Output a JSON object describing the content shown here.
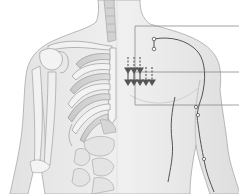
{
  "figure": {
    "left_half": "skeleton (ribcage, clavicle, scapula, humerus) with abdominal organs",
    "right_half": "skin surface with channel/meridian path over shoulder and down arm",
    "colors": {
      "background": "#ffffff",
      "skin": "#ececec",
      "skin_shade": "#d9d9d9",
      "outline": "#9a9a9a",
      "bone": "#f4f4f4",
      "bone_shade": "#c8c8c8",
      "meridian": "#555555",
      "leader_line": "#8a8a8a",
      "arrow": "#555555"
    },
    "leader_lines": [
      {
        "name": "upper-callout",
        "y": 26,
        "x_start": 135,
        "x_end": 239
      },
      {
        "name": "middle-callout",
        "y": 72,
        "x_start": 135,
        "x_end": 239
      },
      {
        "name": "lower-callout",
        "y": 105,
        "x_start": 135,
        "x_end": 239
      }
    ],
    "arrows": {
      "direction": "down",
      "count_upper_row": 3,
      "count_lower_row": 5
    },
    "acupoints": [
      {
        "x": 154,
        "y": 39
      },
      {
        "x": 154,
        "y": 49
      },
      {
        "x": 196,
        "y": 107
      },
      {
        "x": 198,
        "y": 115
      },
      {
        "x": 204,
        "y": 159
      }
    ],
    "labels": []
  }
}
